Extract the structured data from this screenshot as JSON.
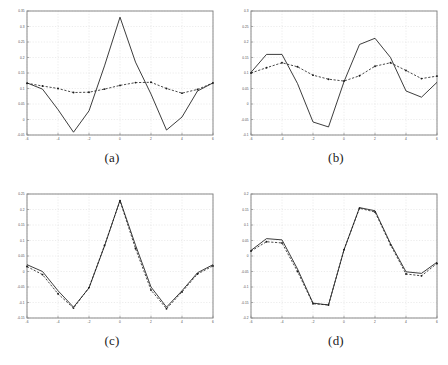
{
  "figure": {
    "title": "",
    "panel_count": 4,
    "layout": "2x2"
  },
  "panels": [
    {
      "id": "a",
      "caption": "(a)",
      "xlabel": "",
      "ylabel": "",
      "xlim": [
        -6,
        6
      ],
      "ylim": [
        -0.05,
        0.35
      ],
      "xticks": [
        -6,
        -4,
        -2,
        0,
        2,
        4,
        6
      ],
      "xticklabels": [
        "-6",
        "-4",
        "-2",
        "0",
        "2",
        "4",
        "6"
      ],
      "yticks": [
        -0.05,
        0,
        0.05,
        0.1,
        0.15,
        0.2,
        0.25,
        0.3,
        0.35
      ],
      "yticklabels": [
        "-0.05",
        "0",
        "0.05",
        "0.1",
        "0.15",
        "0.2",
        "0.25",
        "0.3",
        "0.35"
      ]
    },
    {
      "id": "b",
      "caption": "(b)",
      "xlabel": "",
      "ylabel": "",
      "xlim": [
        -6,
        6
      ],
      "ylim": [
        -0.1,
        0.3
      ],
      "xticks": [
        -6,
        -4,
        -2,
        0,
        2,
        4,
        6
      ],
      "xticklabels": [
        "-6",
        "-4",
        "-2",
        "0",
        "2",
        "4",
        "6"
      ],
      "yticks": [
        -0.1,
        -0.05,
        0,
        0.05,
        0.1,
        0.15,
        0.2,
        0.25,
        0.3
      ],
      "yticklabels": [
        "-0.1",
        "-0.05",
        "0",
        "0.05",
        "0.1",
        "0.15",
        "0.2",
        "0.25",
        "0.3"
      ]
    },
    {
      "id": "c",
      "caption": "(c)",
      "xlabel": "",
      "ylabel": "",
      "xlim": [
        -6,
        6
      ],
      "ylim": [
        -0.15,
        0.25
      ],
      "xticks": [
        -6,
        -4,
        -2,
        0,
        2,
        4,
        6
      ],
      "xticklabels": [
        "-6",
        "-4",
        "-2",
        "0",
        "2",
        "4",
        "6"
      ],
      "yticks": [
        -0.15,
        -0.1,
        -0.05,
        0,
        0.05,
        0.1,
        0.15,
        0.2,
        0.25
      ],
      "yticklabels": [
        "-0.15",
        "-0.1",
        "-0.05",
        "0",
        "0.05",
        "0.1",
        "0.15",
        "0.2",
        "0.25"
      ]
    },
    {
      "id": "d",
      "caption": "(d)",
      "xlabel": "",
      "ylabel": "",
      "xlim": [
        -6,
        6
      ],
      "ylim": [
        -0.2,
        0.2
      ],
      "xticks": [
        -6,
        -4,
        -2,
        0,
        2,
        4,
        6
      ],
      "xticklabels": [
        "-6",
        "-4",
        "-2",
        "0",
        "2",
        "4",
        "6"
      ],
      "yticks": [
        -0.2,
        -0.15,
        -0.1,
        -0.05,
        0,
        0.05,
        0.1,
        0.15,
        0.2
      ],
      "yticklabels": [
        "-0.2",
        "-0.15",
        "-0.1",
        "-0.05",
        "0",
        "0.05",
        "0.1",
        "0.15",
        "0.2"
      ]
    }
  ],
  "chart_data": [
    {
      "type": "line",
      "title": "(a)",
      "xlabel": "",
      "ylabel": "",
      "xlim": [
        -6,
        6
      ],
      "ylim": [
        -0.05,
        0.35
      ],
      "grid": true,
      "legend": "none",
      "x": [
        -6,
        -5,
        -4,
        -3,
        -2,
        -1,
        0,
        1,
        2,
        3,
        4,
        5,
        6
      ],
      "series": [
        {
          "name": "solid",
          "style": "solid",
          "marker": "none",
          "values": [
            0.118,
            0.098,
            0.032,
            -0.041,
            0.028,
            0.173,
            0.33,
            0.185,
            0.082,
            -0.034,
            0.008,
            0.092,
            0.118
          ]
        },
        {
          "name": "dashed",
          "style": "dashed",
          "marker": "dot",
          "values": [
            0.117,
            0.108,
            0.1,
            0.087,
            0.088,
            0.098,
            0.11,
            0.119,
            0.12,
            0.1,
            0.085,
            0.097,
            0.118
          ]
        }
      ]
    },
    {
      "type": "line",
      "title": "(b)",
      "xlabel": "",
      "ylabel": "",
      "xlim": [
        -6,
        6
      ],
      "ylim": [
        -0.1,
        0.3
      ],
      "grid": true,
      "legend": "none",
      "x": [
        -6,
        -5,
        -4,
        -3,
        -2,
        -1,
        0,
        1,
        2,
        3,
        4,
        5,
        6
      ],
      "series": [
        {
          "name": "solid",
          "style": "solid",
          "marker": "none",
          "values": [
            0.102,
            0.16,
            0.16,
            0.066,
            -0.058,
            -0.074,
            0.072,
            0.192,
            0.212,
            0.15,
            0.042,
            0.022,
            0.07
          ]
        },
        {
          "name": "dashed",
          "style": "dashed",
          "marker": "dot",
          "values": [
            0.1,
            0.117,
            0.133,
            0.12,
            0.093,
            0.08,
            0.074,
            0.091,
            0.122,
            0.133,
            0.108,
            0.082,
            0.09
          ]
        }
      ]
    },
    {
      "type": "line",
      "title": "(c)",
      "xlabel": "",
      "ylabel": "",
      "xlim": [
        -6,
        6
      ],
      "ylim": [
        -0.15,
        0.25
      ],
      "grid": true,
      "legend": "none",
      "x": [
        -6,
        -5,
        -4,
        -3,
        -2,
        -1,
        0,
        1,
        2,
        3,
        4,
        5,
        6
      ],
      "series": [
        {
          "name": "solid",
          "style": "solid",
          "marker": "none",
          "values": [
            0.022,
            0.0,
            -0.062,
            -0.115,
            -0.053,
            0.082,
            0.23,
            0.085,
            -0.05,
            -0.115,
            -0.062,
            -0.004,
            0.022
          ]
        },
        {
          "name": "dashed",
          "style": "dashed",
          "marker": "dot",
          "values": [
            0.016,
            -0.01,
            -0.072,
            -0.118,
            -0.052,
            0.084,
            0.228,
            0.074,
            -0.06,
            -0.12,
            -0.066,
            -0.008,
            0.018
          ]
        }
      ]
    },
    {
      "type": "line",
      "title": "(d)",
      "xlabel": "",
      "ylabel": "",
      "xlim": [
        -6,
        6
      ],
      "ylim": [
        -0.2,
        0.2
      ],
      "grid": true,
      "legend": "none",
      "x": [
        -6,
        -5,
        -4,
        -3,
        -2,
        -1,
        0,
        1,
        2,
        3,
        4,
        5,
        6
      ],
      "series": [
        {
          "name": "solid",
          "style": "solid",
          "marker": "none",
          "values": [
            0.018,
            0.056,
            0.052,
            -0.042,
            -0.152,
            -0.158,
            0.02,
            0.156,
            0.146,
            0.04,
            -0.051,
            -0.056,
            -0.02
          ]
        },
        {
          "name": "dashed",
          "style": "dashed",
          "marker": "dot",
          "values": [
            0.016,
            0.046,
            0.042,
            -0.05,
            -0.154,
            -0.158,
            0.02,
            0.154,
            0.142,
            0.036,
            -0.058,
            -0.064,
            -0.024
          ]
        }
      ]
    }
  ]
}
